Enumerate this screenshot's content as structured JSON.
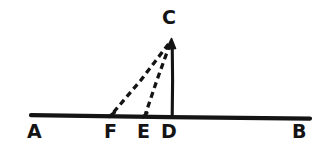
{
  "figure": {
    "kind": "geometry-diagram",
    "background_color": "#ffffff",
    "ink_color": "#141414",
    "labels": {
      "a": "A",
      "b": "B",
      "c": "C",
      "d": "D",
      "e": "E",
      "f": "F"
    },
    "label_positions": {
      "a": {
        "x": 27,
        "y": 122
      },
      "b": {
        "x": 292,
        "y": 122
      },
      "c": {
        "x": 162,
        "y": 8
      },
      "d": {
        "x": 161,
        "y": 122
      },
      "e": {
        "x": 137,
        "y": 122
      },
      "f": {
        "x": 104,
        "y": 122
      }
    },
    "points": {
      "a": {
        "x": 31,
        "y": 116
      },
      "b": {
        "x": 310,
        "y": 118
      },
      "c": {
        "x": 172,
        "y": 40
      },
      "d": {
        "x": 172,
        "y": 116
      },
      "e": {
        "x": 145,
        "y": 116
      },
      "f": {
        "x": 112,
        "y": 115
      }
    },
    "segments": [
      {
        "name": "baseline-ab",
        "from": "a",
        "to": "b",
        "style": "solid",
        "width": 4
      },
      {
        "name": "segment-cd",
        "from": "c",
        "to": "d",
        "style": "solid",
        "width": 3
      },
      {
        "name": "segment-ce",
        "from": "c",
        "to": "e",
        "style": "dashed",
        "width": 3
      },
      {
        "name": "segment-cf",
        "from": "c",
        "to": "f",
        "style": "dashed",
        "width": 3
      }
    ],
    "dash_pattern": "6 4"
  }
}
